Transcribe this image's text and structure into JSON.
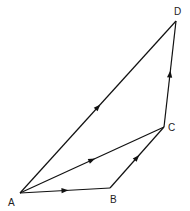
{
  "diagram": {
    "type": "vector-polygon",
    "vertices": [
      {
        "id": "A",
        "label": "A",
        "x": 20,
        "y": 193,
        "lx": 8,
        "ly": 206
      },
      {
        "id": "B",
        "label": "B",
        "x": 110,
        "y": 188,
        "lx": 110,
        "ly": 203
      },
      {
        "id": "C",
        "label": "C",
        "x": 164,
        "y": 127,
        "lx": 168,
        "ly": 131
      },
      {
        "id": "D",
        "label": "D",
        "x": 176,
        "y": 21,
        "lx": 174,
        "ly": 15
      }
    ],
    "edges": [
      {
        "from": "A",
        "to": "B",
        "arrow": true
      },
      {
        "from": "B",
        "to": "C",
        "arrow": true
      },
      {
        "from": "A",
        "to": "C",
        "arrow": true
      },
      {
        "from": "C",
        "to": "D",
        "arrow": true
      },
      {
        "from": "A",
        "to": "D",
        "arrow": true
      }
    ]
  }
}
